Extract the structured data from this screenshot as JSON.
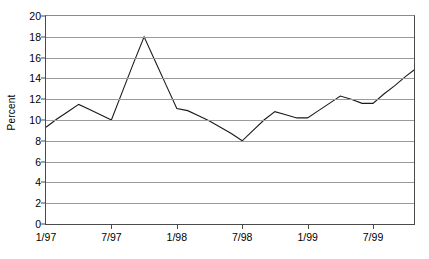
{
  "chart_data": {
    "type": "line",
    "title": "",
    "xlabel": "",
    "ylabel": "Percent",
    "ylim": [
      0,
      20
    ],
    "ytick_step": 2,
    "yticks": [
      0,
      2,
      4,
      6,
      8,
      10,
      12,
      14,
      16,
      18,
      20
    ],
    "grid": true,
    "legend": false,
    "legend_position": "none",
    "line_color": "#1a1a1a",
    "grid_color": "#9a9a9a",
    "axis_color": "#4a4a4a",
    "background": "#ffffff",
    "x_tick_labels": [
      "1/97",
      "7/97",
      "1/98",
      "7/98",
      "1/99",
      "7/99"
    ],
    "x_tick_indices": [
      0,
      6,
      12,
      18,
      24,
      30
    ],
    "x": [
      "1/97",
      "2/97",
      "3/97",
      "4/97",
      "5/97",
      "6/97",
      "7/97",
      "8/97",
      "9/97",
      "10/97",
      "11/97",
      "12/97",
      "1/98",
      "2/98",
      "3/98",
      "4/98",
      "5/98",
      "6/98",
      "7/98",
      "8/98",
      "9/98",
      "10/98",
      "11/98",
      "12/98",
      "1/99",
      "2/99",
      "3/99",
      "4/99",
      "5/99",
      "6/99",
      "7/99",
      "8/99",
      "9/99",
      "10/99",
      "11/99"
    ],
    "series": [
      {
        "name": "Percent",
        "values": [
          9.3,
          10.1,
          10.8,
          11.5,
          11.0,
          10.5,
          10.0,
          12.7,
          15.4,
          18.0,
          15.7,
          13.4,
          11.1,
          10.9,
          10.4,
          9.9,
          9.3,
          8.7,
          8.0,
          9.0,
          10.0,
          10.8,
          10.5,
          10.2,
          10.2,
          10.9,
          11.6,
          12.3,
          12.0,
          11.6,
          11.6,
          12.5,
          13.3,
          14.2,
          15.0
        ]
      }
    ],
    "annotations": {
      "peak_label": "18",
      "peak_x": "10/97",
      "trough_label": "8",
      "trough_x": "7/98",
      "start_value": "9.3",
      "end_value": "15.0"
    }
  }
}
